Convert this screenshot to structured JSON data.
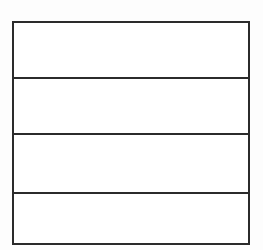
{
  "table": {
    "rows": [
      {
        "content": ""
      },
      {
        "content": ""
      },
      {
        "content": ""
      },
      {
        "content": ""
      }
    ]
  },
  "colors": {
    "background": "#fdfdfd",
    "table_background": "#ffffff",
    "border": "#2b2b2b"
  }
}
